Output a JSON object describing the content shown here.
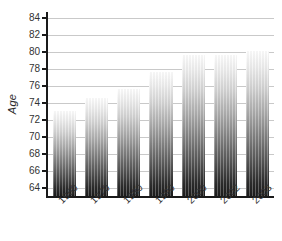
{
  "chart_data": {
    "type": "bar",
    "title": "",
    "xlabel": "",
    "ylabel": "Age",
    "categories": [
      "1960",
      "1970",
      "1980",
      "1990",
      "2000",
      "2002",
      "2003"
    ],
    "values": [
      73.0,
      74.6,
      75.6,
      77.6,
      79.6,
      79.7,
      80.1
    ],
    "ylim": [
      63.0,
      84.5
    ],
    "yticks": [
      64,
      66,
      68,
      70,
      72,
      74,
      76,
      78,
      80,
      82,
      84
    ],
    "ytick_labels": [
      "64",
      "66",
      "68",
      "70",
      "72",
      "74",
      "76",
      "78",
      "80",
      "82",
      "84"
    ],
    "grid": "horizontal",
    "legend": "none",
    "bar_style": {
      "fill": "vertical-gradient-white-to-black",
      "top_color": "#ffffff",
      "bottom_color": "#1c1c1c",
      "striped": true
    },
    "axis_color": "#1a1a1a",
    "gridline_color": "#c9c9c9"
  }
}
